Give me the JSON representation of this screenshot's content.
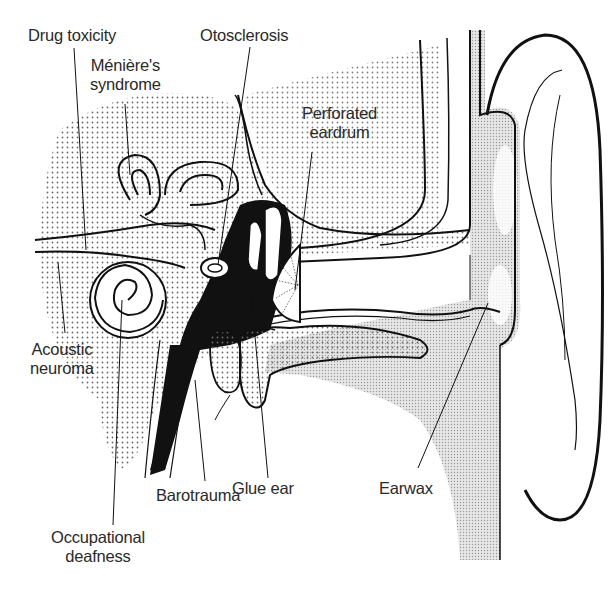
{
  "diagram": {
    "colors": {
      "ink": "#111111",
      "label_text": "#2a2a2a",
      "stipple": "#8a8a8a",
      "light_shade": "#d4d4d4",
      "background": "#ffffff"
    }
  },
  "labels": {
    "drug_toxicity": {
      "lines": [
        "Drug toxicity"
      ]
    },
    "menieres": {
      "lines": [
        "Ménière's",
        "syndrome"
      ]
    },
    "otosclerosis": {
      "lines": [
        "Otosclerosis"
      ]
    },
    "perforated_eardrum": {
      "lines": [
        "Perforated",
        "eardrum"
      ]
    },
    "acoustic_neuroma": {
      "lines": [
        "Acoustic",
        "neuroma"
      ]
    },
    "glue_ear": {
      "lines": [
        "Glue ear"
      ]
    },
    "earwax": {
      "lines": [
        "Earwax"
      ]
    },
    "barotrauma": {
      "lines": [
        "Barotrauma"
      ]
    },
    "occupational_deafness": {
      "lines": [
        "Occupational",
        "deafness"
      ]
    }
  }
}
